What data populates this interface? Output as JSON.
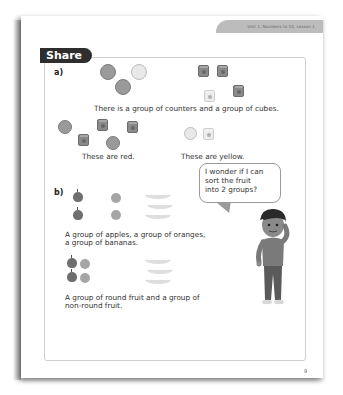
{
  "header": {
    "unit_label": "Unit 1: Numbers to 10, Lesson 1"
  },
  "section": {
    "title": "Share"
  },
  "part_a": {
    "label": "a)",
    "caption": "There is a group of counters and a group of cubes.",
    "red_caption": "These are red.",
    "yellow_caption": "These are yellow."
  },
  "part_b": {
    "label": "b)",
    "caption_line1": "A group of apples, a group of oranges,",
    "caption_line2": "a group of bananas.",
    "caption2_line1": "A group of round fruit and a group of",
    "caption2_line2": "non-round fruit."
  },
  "speech_bubble": {
    "line1": "I wonder if I can",
    "line2": "sort the fruit",
    "line3": "into 2 groups?"
  },
  "footer": {
    "page_number": "9"
  },
  "colors": {
    "tab_dark": "#2e2e2e",
    "header_tab": "#bcbcbc",
    "box_border": "#cfcfcf"
  }
}
